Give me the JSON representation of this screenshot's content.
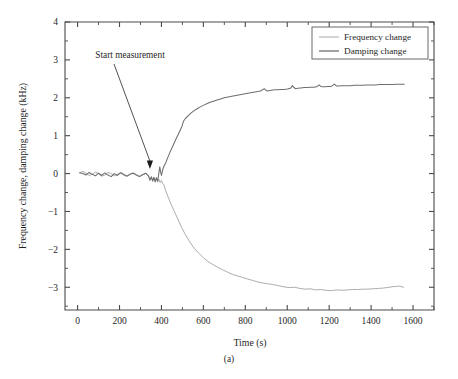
{
  "figure": {
    "caption": "(a)"
  },
  "chart_data": {
    "type": "line",
    "title": "",
    "xlabel": "Time (s)",
    "ylabel": "Frequency change, damping change (kHz)",
    "xlim": [
      -60,
      1700
    ],
    "ylim": [
      -3.6,
      4.0
    ],
    "xticks": [
      0,
      200,
      400,
      600,
      800,
      1000,
      1200,
      1400,
      1600
    ],
    "xticklabels": [
      "0",
      "200",
      "400",
      "600",
      "800",
      "1000",
      "1200",
      "1400",
      "1600"
    ],
    "xminor_step": 100,
    "yticks": [
      -3,
      -2,
      -1,
      0,
      1,
      2,
      3,
      4
    ],
    "yticklabels": [
      "−3",
      "−2",
      "−1",
      "0",
      "1",
      "2",
      "3",
      "4"
    ],
    "yminor_step": 0.5,
    "grid": false,
    "legend_position": "top-right",
    "annotations": [
      {
        "text": "Start measurement",
        "text_x": 250,
        "text_y": 3.05,
        "arrow_to_x": 345,
        "arrow_to_y": 0.12
      }
    ],
    "series": [
      {
        "name": "Frequency change",
        "color": "#a8a8a8",
        "x": [
          10,
          25,
          40,
          55,
          70,
          85,
          100,
          115,
          130,
          145,
          160,
          175,
          190,
          205,
          220,
          235,
          250,
          265,
          280,
          295,
          310,
          325,
          338,
          345,
          352,
          358,
          364,
          370,
          376,
          382,
          388,
          394,
          400,
          406,
          412,
          420,
          432,
          445,
          460,
          478,
          496,
          515,
          535,
          556,
          578,
          600,
          622,
          645,
          668,
          692,
          715,
          738,
          762,
          786,
          810,
          835,
          860,
          885,
          910,
          935,
          960,
          985,
          1010,
          1035,
          1060,
          1085,
          1110,
          1135,
          1160,
          1185,
          1210,
          1235,
          1260,
          1285,
          1310,
          1335,
          1360,
          1385,
          1410,
          1435,
          1460,
          1485,
          1510,
          1535,
          1555
        ],
        "y": [
          0.02,
          0.06,
          0.01,
          -0.05,
          -0.02,
          0.04,
          0.0,
          -0.07,
          -0.04,
          0.03,
          0.0,
          -0.06,
          -0.02,
          0.03,
          -0.01,
          -0.06,
          -0.02,
          0.02,
          -0.02,
          -0.07,
          -0.03,
          0.0,
          -0.05,
          -0.14,
          -0.08,
          -0.18,
          -0.1,
          -0.2,
          -0.12,
          -0.22,
          -0.15,
          -0.24,
          -0.18,
          -0.26,
          -0.3,
          -0.45,
          -0.62,
          -0.8,
          -0.98,
          -1.2,
          -1.42,
          -1.62,
          -1.8,
          -1.97,
          -2.1,
          -2.22,
          -2.32,
          -2.4,
          -2.47,
          -2.54,
          -2.6,
          -2.66,
          -2.7,
          -2.74,
          -2.78,
          -2.82,
          -2.86,
          -2.89,
          -2.91,
          -2.93,
          -2.96,
          -2.99,
          -3.01,
          -3.0,
          -3.03,
          -3.05,
          -3.04,
          -3.07,
          -3.06,
          -3.08,
          -3.09,
          -3.07,
          -3.08,
          -3.07,
          -3.06,
          -3.06,
          -3.05,
          -3.05,
          -3.04,
          -3.03,
          -3.02,
          -3.0,
          -2.98,
          -2.97,
          -3.0
        ]
      },
      {
        "name": "Damping change",
        "color": "#6e6e6e",
        "x": [
          10,
          25,
          40,
          55,
          70,
          85,
          100,
          115,
          130,
          145,
          160,
          175,
          190,
          205,
          220,
          235,
          250,
          265,
          280,
          295,
          310,
          325,
          338,
          345,
          352,
          358,
          364,
          370,
          376,
          382,
          388,
          392,
          396,
          400,
          406,
          412,
          420,
          430,
          442,
          456,
          470,
          484,
          498,
          505,
          515,
          528,
          542,
          556,
          570,
          585,
          600,
          616,
          632,
          648,
          665,
          682,
          700,
          718,
          736,
          755,
          774,
          793,
          812,
          832,
          852,
          872,
          882,
          890,
          898,
          906,
          915,
          925,
          940,
          955,
          970,
          985,
          1000,
          1015,
          1025,
          1032,
          1040,
          1050,
          1065,
          1080,
          1095,
          1110,
          1125,
          1140,
          1152,
          1160,
          1168,
          1180,
          1195,
          1210,
          1225,
          1235,
          1245,
          1260,
          1280,
          1300,
          1320,
          1340,
          1360,
          1380,
          1400,
          1420,
          1440,
          1460,
          1480,
          1500,
          1520,
          1540,
          1558
        ],
        "y": [
          0.02,
          0.0,
          -0.04,
          0.03,
          -0.02,
          -0.06,
          0.01,
          -0.05,
          0.02,
          -0.04,
          -0.08,
          0.0,
          -0.05,
          0.02,
          -0.03,
          -0.07,
          -0.02,
          0.01,
          -0.04,
          -0.08,
          -0.03,
          0.01,
          -0.06,
          -0.18,
          -0.09,
          -0.2,
          -0.1,
          -0.22,
          -0.11,
          -0.2,
          0.02,
          0.18,
          0.05,
          -0.05,
          0.1,
          0.2,
          0.28,
          0.42,
          0.58,
          0.75,
          0.92,
          1.08,
          1.25,
          1.38,
          1.46,
          1.53,
          1.6,
          1.66,
          1.71,
          1.76,
          1.8,
          1.84,
          1.88,
          1.91,
          1.94,
          1.97,
          2.0,
          2.02,
          2.04,
          2.06,
          2.08,
          2.1,
          2.12,
          2.14,
          2.16,
          2.18,
          2.21,
          2.24,
          2.2,
          2.18,
          2.19,
          2.2,
          2.21,
          2.21,
          2.22,
          2.22,
          2.23,
          2.25,
          2.32,
          2.27,
          2.24,
          2.25,
          2.26,
          2.27,
          2.27,
          2.28,
          2.28,
          2.29,
          2.34,
          2.3,
          2.29,
          2.29,
          2.3,
          2.3,
          2.36,
          2.31,
          2.31,
          2.32,
          2.32,
          2.32,
          2.33,
          2.33,
          2.33,
          2.34,
          2.34,
          2.34,
          2.35,
          2.35,
          2.35,
          2.35,
          2.36,
          2.36,
          2.36
        ]
      }
    ],
    "legend": [
      {
        "label": "Frequency change",
        "color": "#a8a8a8"
      },
      {
        "label": "Damping change",
        "color": "#6e6e6e"
      }
    ]
  }
}
